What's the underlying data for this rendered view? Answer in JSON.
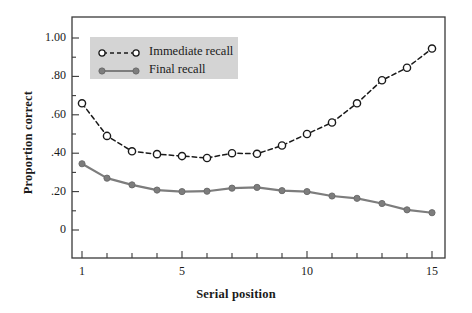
{
  "figure": {
    "background": "#ffffff",
    "frame_color": "#3a3a3a"
  },
  "chart_data": {
    "type": "line",
    "title": "",
    "subtitle": "",
    "xlabel": "Serial position",
    "ylabel": "Proportion correct",
    "x": [
      1,
      2,
      3,
      4,
      5,
      6,
      7,
      8,
      9,
      10,
      11,
      12,
      13,
      14,
      15
    ],
    "xlim": [
      1,
      15
    ],
    "ylim": [
      0,
      1.04
    ],
    "xticks": [
      1,
      2,
      3,
      4,
      5,
      6,
      7,
      8,
      9,
      10,
      11,
      12,
      13,
      14,
      15
    ],
    "xtick_labels": [
      "1",
      "",
      "",
      "",
      "5",
      "",
      "",
      "",
      "",
      "10",
      "",
      "",
      "",
      "",
      "15"
    ],
    "yticks": [
      0,
      0.1,
      0.2,
      0.3,
      0.4,
      0.5,
      0.6,
      0.7,
      0.8,
      0.9,
      1.0
    ],
    "ytick_labels": [
      "0",
      "",
      ".20",
      "",
      ".40",
      "",
      ".60",
      "",
      ".80",
      "",
      "1.00"
    ],
    "grid": false,
    "legend_position": "upper left",
    "series": [
      {
        "name": "Immediate recall",
        "color": "#1a1a1a",
        "linestyle": "dashed",
        "marker": "open-circle",
        "values": [
          0.66,
          0.49,
          0.41,
          0.395,
          0.385,
          0.375,
          0.4,
          0.397,
          0.44,
          0.5,
          0.56,
          0.66,
          0.78,
          0.845,
          0.945
        ]
      },
      {
        "name": "Final recall",
        "color": "#7d7d7d",
        "linestyle": "solid",
        "marker": "filled-circle",
        "values": [
          0.345,
          0.27,
          0.235,
          0.208,
          0.2,
          0.202,
          0.218,
          0.222,
          0.205,
          0.2,
          0.177,
          0.165,
          0.138,
          0.105,
          0.09
        ]
      }
    ]
  },
  "legend": {
    "entries": [
      {
        "label": "Immediate recall",
        "icon": "dashed-open-circle-line-icon"
      },
      {
        "label": "Final recall",
        "icon": "solid-filled-circle-line-icon"
      }
    ],
    "background": "#d4d4d4"
  }
}
